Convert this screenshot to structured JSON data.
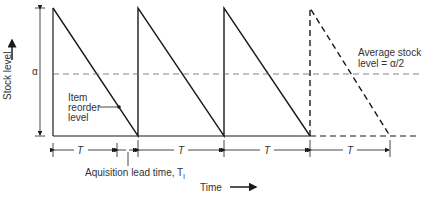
{
  "diagram": {
    "y_axis_label": "Stock level",
    "x_axis_label": "Time",
    "alpha_label": "α",
    "reorder_label_lines": [
      "Item",
      "reorder",
      "level"
    ],
    "average_label_lines": [
      "Average stock",
      "level = α/2"
    ],
    "lead_time_label": "Aquisition lead time, T",
    "lead_time_subscript": "l",
    "period_labels": [
      "T",
      "T",
      "T",
      "T"
    ],
    "colors": {
      "line": "#1a1a1a",
      "dashed": "#555555",
      "background": "#ffffff"
    }
  }
}
